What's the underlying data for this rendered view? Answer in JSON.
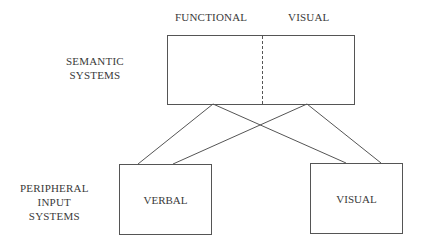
{
  "diagram": {
    "headers": {
      "functional": "FUNCTIONAL",
      "visual": "VISUAL"
    },
    "row_labels": {
      "semantic": [
        "SEMANTIC",
        "SYSTEMS"
      ],
      "peripheral": [
        "PERIPHERAL",
        "INPUT",
        "SYSTEMS"
      ]
    },
    "nodes": {
      "semantic_box": {
        "left_section": "",
        "right_section": "",
        "divider": "dashed"
      },
      "verbal_box": {
        "label": "VERBAL"
      },
      "visual_box": {
        "label": "VISUAL"
      }
    },
    "connections": [
      {
        "from": "semantic-functional",
        "to": "verbal"
      },
      {
        "from": "semantic-functional",
        "to": "visual"
      },
      {
        "from": "semantic-visual",
        "to": "verbal"
      },
      {
        "from": "semantic-visual",
        "to": "visual"
      }
    ],
    "line_color": "#555555"
  }
}
